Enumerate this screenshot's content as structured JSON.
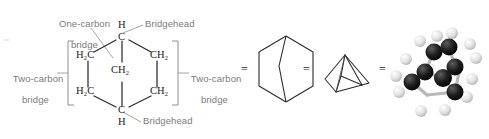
{
  "figure": {
    "equivalence_symbol": "=",
    "label_color": "#7b7b7b",
    "atom_color": "#1a1a1a",
    "bond_color": "#2b2b2b",
    "background": "#ffffff"
  },
  "callouts": {
    "one_carbon_bridge": {
      "line1": "One-carbon",
      "line2": "bridge"
    },
    "bridgehead_top": "Bridgehead",
    "bridgehead_bottom": "Bridgehead",
    "two_carbon_bridge_left": {
      "line1": "Two-carbon",
      "line2": "bridge"
    },
    "two_carbon_bridge_right": {
      "line1": "Two-carbon",
      "line2": "bridge"
    }
  },
  "condensed_structure": {
    "name": "condensed-formula-structure",
    "atoms": [
      {
        "id": "top-bridgehead-h",
        "text": "H"
      },
      {
        "id": "top-bridgehead-c",
        "text": "C"
      },
      {
        "id": "upper-left-ch2",
        "text": "H₂C"
      },
      {
        "id": "upper-right-ch2",
        "text": "CH₂"
      },
      {
        "id": "center-bridge-ch2",
        "text": "CH₂"
      },
      {
        "id": "lower-left-ch2",
        "text": "H₂C"
      },
      {
        "id": "lower-right-ch2",
        "text": "CH₂"
      },
      {
        "id": "bottom-bridgehead-c",
        "text": "C"
      },
      {
        "id": "bottom-bridgehead-h",
        "text": "H"
      }
    ]
  },
  "representations": [
    {
      "id": "condensed",
      "label": "condensed formula with labeled bridges"
    },
    {
      "id": "hexagon-skeletal",
      "label": "hexagonal skeletal structure"
    },
    {
      "id": "perspective-skeletal",
      "label": "three-dimensional perspective skeletal structure"
    },
    {
      "id": "ball-and-stick",
      "label": "ball-and-stick molecular model"
    }
  ],
  "ball_and_stick": {
    "carbon_color": "#141414",
    "hydrogen_color": "#e8e8e8",
    "bond_color": "#b9b9b9",
    "carbon_count": 7,
    "hydrogen_count": 12
  }
}
